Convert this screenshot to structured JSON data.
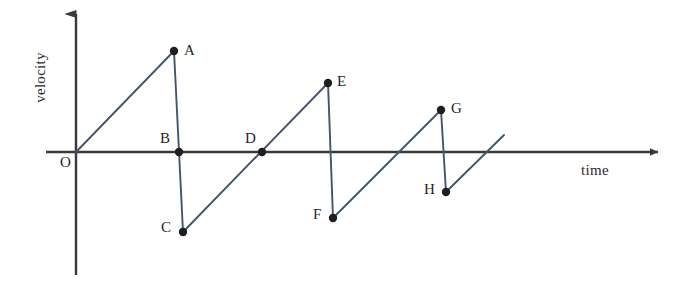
{
  "figure": {
    "background_color": "#ffffff",
    "axis_color": "#3a3a3a",
    "curve_color": "#44566b",
    "point_color": "#1f1f1f"
  },
  "axes": {
    "vertical": {
      "label": "velocity",
      "x": 76,
      "top_y": 8,
      "bottom_y": 275,
      "arrow": "up-arrow-icon"
    },
    "horizontal": {
      "label": "time",
      "y": 152,
      "left_x": 46,
      "right_x": 666,
      "arrow": "right-arrow-icon"
    },
    "origin": {
      "label": "O",
      "x": 76,
      "y": 152
    }
  },
  "chart_data": {
    "type": "line",
    "title": "",
    "xlabel": "time",
    "ylabel": "velocity",
    "grid": false,
    "legend": null,
    "axis_ticks": {
      "x": [],
      "y": []
    },
    "labeled_points": [
      {
        "name": "O",
        "px": 76,
        "py": 152,
        "label_px": 60,
        "label_py": 155,
        "marker": false,
        "x": 0.0,
        "y": 0.0
      },
      {
        "name": "A",
        "px": 174,
        "py": 51,
        "label_px": 184,
        "label_py": 43,
        "marker": true,
        "x": 1.0,
        "y": 1.0
      },
      {
        "name": "B",
        "px": 179,
        "py": 152,
        "label_px": 160,
        "label_py": 131,
        "marker": true,
        "x": 1.05,
        "y": 0.0
      },
      {
        "name": "C",
        "px": 183,
        "py": 232,
        "label_px": 161,
        "label_py": 220,
        "marker": true,
        "x": 1.09,
        "y": -0.79
      },
      {
        "name": "D",
        "px": 262,
        "py": 152,
        "label_px": 245,
        "label_py": 131,
        "marker": true,
        "x": 1.9,
        "y": 0.0
      },
      {
        "name": "E",
        "px": 328,
        "py": 83,
        "label_px": 337,
        "label_py": 74,
        "marker": true,
        "x": 2.57,
        "y": 0.68
      },
      {
        "name": "F",
        "px": 333,
        "py": 218,
        "label_px": 313,
        "label_py": 207,
        "marker": true,
        "x": 2.62,
        "y": -0.65
      },
      {
        "name": "G",
        "px": 441,
        "py": 110,
        "label_px": 451,
        "label_py": 101,
        "marker": true,
        "x": 3.72,
        "y": 0.42
      },
      {
        "name": "H",
        "px": 446,
        "py": 192,
        "label_px": 424,
        "label_py": 182,
        "marker": true,
        "x": 3.77,
        "y": -0.4
      }
    ],
    "segments": [
      {
        "name": "ramp-O-to-A",
        "from": "O",
        "to": "A",
        "x1": 76,
        "y1": 152,
        "x2": 174,
        "y2": 51
      },
      {
        "name": "drop-A-to-C",
        "from": "A",
        "to": "C",
        "x1": 174,
        "y1": 51,
        "x2": 183,
        "y2": 232
      },
      {
        "name": "ramp-C-to-E",
        "from": "C",
        "to": "E",
        "x1": 183,
        "y1": 232,
        "x2": 328,
        "y2": 83
      },
      {
        "name": "drop-E-to-F",
        "from": "E",
        "to": "F",
        "x1": 328,
        "y1": 83,
        "x2": 333,
        "y2": 218
      },
      {
        "name": "ramp-F-to-G",
        "from": "F",
        "to": "G",
        "x1": 333,
        "y1": 218,
        "x2": 441,
        "y2": 110
      },
      {
        "name": "drop-G-to-H",
        "from": "G",
        "to": "H",
        "x1": 441,
        "y1": 110,
        "x2": 446,
        "y2": 192
      },
      {
        "name": "ramp-H-to-end",
        "from": "H",
        "to": "",
        "x1": 446,
        "y1": 192,
        "x2": 504,
        "y2": 135
      }
    ],
    "zero_crossings": [
      "B",
      "D"
    ],
    "peaks": [
      "A",
      "E",
      "G"
    ],
    "troughs": [
      "C",
      "F",
      "H"
    ]
  }
}
